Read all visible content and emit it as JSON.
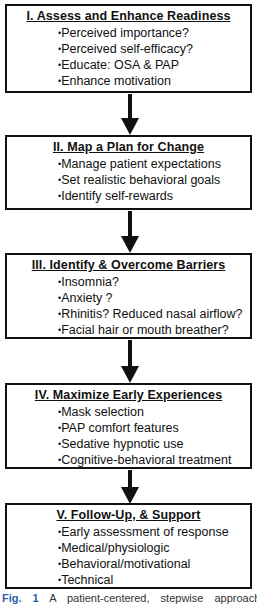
{
  "diagram": {
    "steps": [
      {
        "title": "I. Assess and Enhance Readiness",
        "items": [
          "Perceived  importance?",
          "Perceived self-efficacy?",
          "Educate: OSA & PAP",
          "Enhance motivation"
        ]
      },
      {
        "title": "II. Map a Plan for Change",
        "items": [
          "Manage patient expectations",
          "Set realistic behavioral goals",
          "Identify self-rewards"
        ]
      },
      {
        "title": "III. Identify & Overcome Barriers",
        "items": [
          "Insomnia?",
          "Anxiety ?",
          "Rhinitis? Reduced nasal airflow?",
          "Facial hair or mouth breather?"
        ]
      },
      {
        "title": "IV. Maximize Early Experiences",
        "items": [
          "Mask selection",
          "PAP comfort features",
          "Sedative hypnotic use",
          "Cognitive-behavioral  treatment"
        ]
      },
      {
        "title": "V. Follow-Up, & Support",
        "items": [
          "Early assessment of response",
          "Medical/physiologic",
          "Behavioral/motivational",
          "Technical"
        ]
      }
    ],
    "arrows": [
      "I→II",
      "II→III",
      "III→IV",
      "IV→V"
    ]
  },
  "caption": {
    "label": "Fig. 1",
    "text": "A patient-centered, stepwise approach to"
  },
  "colors": {
    "border": "#111111",
    "background": "#ffffff",
    "caption_label": "#2a5fa8"
  }
}
